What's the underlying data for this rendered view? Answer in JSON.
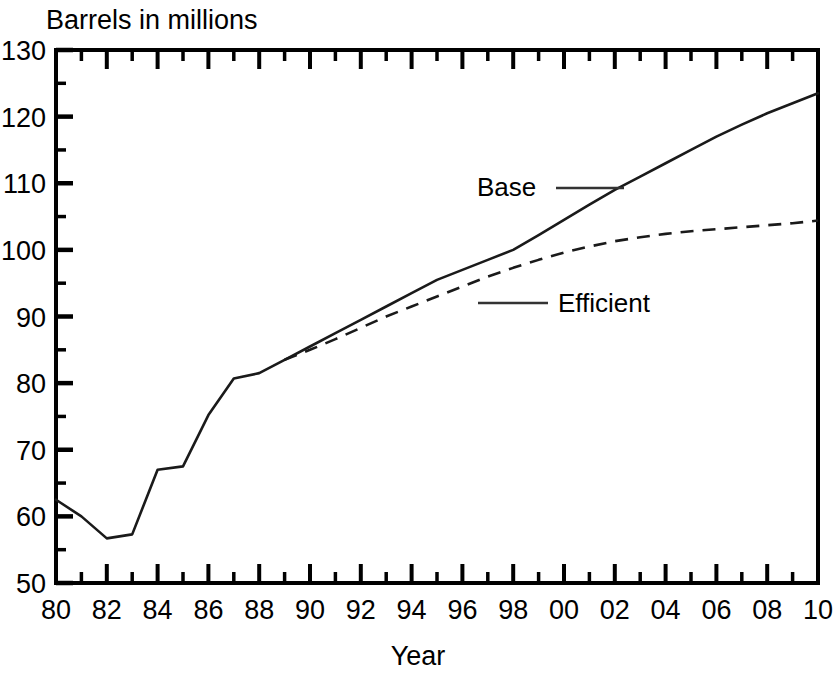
{
  "chart_data": {
    "type": "line",
    "title": "Barrels in millions",
    "subtitle": "",
    "xlabel": "Year",
    "ylabel": "Barrels in millions",
    "ylim": [
      50,
      130
    ],
    "xlim": [
      1980,
      2010
    ],
    "grid": false,
    "legend_position": "inline-annotation",
    "y_ticks": [
      "50",
      "60",
      "70",
      "80",
      "90",
      "100",
      "110",
      "120",
      "130"
    ],
    "y_tick_values": [
      50,
      60,
      70,
      80,
      90,
      100,
      110,
      120,
      130
    ],
    "y_minor_step": 5,
    "x_ticks": [
      "80",
      "82",
      "84",
      "86",
      "88",
      "90",
      "92",
      "94",
      "96",
      "98",
      "00",
      "02",
      "04",
      "06",
      "08",
      "10"
    ],
    "x_tick_values": [
      1980,
      1982,
      1984,
      1986,
      1988,
      1990,
      1992,
      1994,
      1996,
      1998,
      2000,
      2002,
      2004,
      2006,
      2008,
      2010
    ],
    "x_minor_step": 1,
    "x": [
      1980,
      1981,
      1982,
      1983,
      1984,
      1985,
      1986,
      1987,
      1988,
      1989,
      1990,
      1991,
      1992,
      1993,
      1994,
      1995,
      1996,
      1997,
      1998,
      1999,
      2000,
      2001,
      2002,
      2003,
      2004,
      2005,
      2006,
      2007,
      2008,
      2009,
      2010
    ],
    "series": [
      {
        "name": "Base",
        "style": "solid",
        "color": "#1a1a1a",
        "values": [
          62.5,
          60.0,
          56.7,
          57.3,
          67.0,
          67.5,
          75.2,
          80.7,
          81.5,
          83.5,
          85.5,
          87.5,
          89.5,
          91.5,
          93.5,
          95.5,
          97.0,
          98.5,
          100.0,
          102.2,
          104.5,
          106.8,
          109.0,
          111.0,
          113.0,
          115.0,
          117.0,
          118.8,
          120.5,
          122.0,
          123.5
        ]
      },
      {
        "name": "Efficient",
        "style": "dashed",
        "color": "#1a1a1a",
        "values": [
          null,
          null,
          null,
          null,
          null,
          null,
          null,
          null,
          null,
          83.5,
          85.0,
          86.6,
          88.3,
          90.0,
          91.5,
          93.0,
          94.5,
          96.0,
          97.3,
          98.5,
          99.6,
          100.5,
          101.3,
          101.9,
          102.4,
          102.8,
          103.1,
          103.4,
          103.7,
          104.0,
          104.4
        ]
      }
    ],
    "annotations": [
      {
        "text": "Base",
        "for_series": "Base",
        "leader": "right"
      },
      {
        "text": "Efficient",
        "for_series": "Efficient",
        "leader": "left"
      }
    ]
  }
}
